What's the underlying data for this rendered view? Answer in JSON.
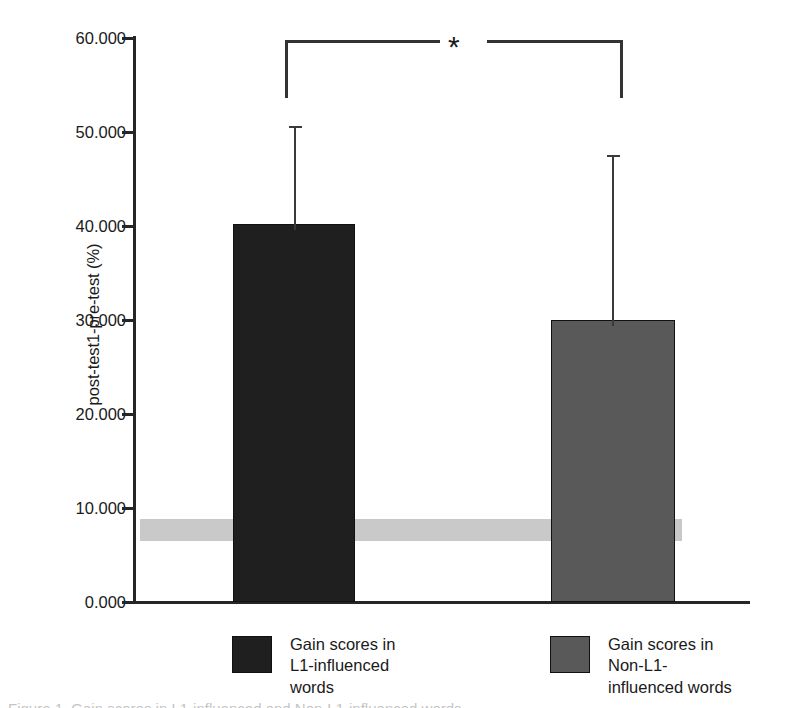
{
  "chart_data": {
    "type": "bar",
    "title": "",
    "xlabel": "",
    "ylabel": "post-test1-pre-test (%)",
    "categories": [
      "Gain scores in L1-influenced words",
      "Gain scores in Non-L1-influenced words"
    ],
    "values": [
      40.0,
      30.0
    ],
    "errors_upper": [
      10.6,
      17.5
    ],
    "error_tops": [
      50.6,
      47.5
    ],
    "ylim": [
      0,
      60
    ],
    "ytick_labels": [
      "60.000",
      "50.000",
      "40.000",
      "30.000",
      "20.000",
      "10.000",
      "0.000"
    ],
    "ytick_values": [
      60,
      50,
      40,
      30,
      20,
      10,
      0
    ],
    "grid": false,
    "legend_position": "below-axis",
    "bar_colors": [
      "#1f1f1f",
      "#595959"
    ],
    "reference_band": {
      "label": "",
      "upper": 8.8,
      "lower": 6.5,
      "color": "#c9c9c9"
    },
    "annotations": [
      {
        "type": "significance-bracket",
        "label": "*",
        "between": [
          "Gain scores in L1-influenced words",
          "Gain scores in Non-L1-influenced words"
        ],
        "level": 62.3
      }
    ]
  },
  "axis": {
    "y_title": "post-test1-pre-test (%)",
    "ticks": [
      {
        "label": "60.000",
        "y": 38
      },
      {
        "label": "50.000",
        "y": 132
      },
      {
        "label": "40.000",
        "y": 226
      },
      {
        "label": "30.000",
        "y": 320
      },
      {
        "label": "20.000",
        "y": 414
      },
      {
        "label": "10.000",
        "y": 508
      },
      {
        "label": "0.000",
        "y": 602
      }
    ]
  },
  "bars": [
    {
      "name": "l1-influenced",
      "value": 40.0,
      "color": "#1f1f1f",
      "x": 233,
      "width": 122,
      "top": 224,
      "height": 378,
      "error_center_x": 294,
      "error_top": 126,
      "error_cap_width": 13
    },
    {
      "name": "non-l1-influenced",
      "value": 30.0,
      "color": "#595959",
      "x": 551,
      "width": 124,
      "top": 320,
      "height": 282,
      "error_center_x": 612,
      "error_top": 155,
      "error_cap_width": 13
    }
  ],
  "significance": {
    "star": "*",
    "left_arm_x": 285,
    "right_arm_x": 620,
    "top_y": 40,
    "bottom_y": 98,
    "gap_left": 440,
    "gap_right": 487
  },
  "legend": {
    "items": [
      {
        "name": "l1-influenced",
        "label": "Gain scores in\nL1-influenced\nwords",
        "color": "#1f1f1f",
        "x": 232,
        "y": 22
      },
      {
        "name": "non-l1-influenced",
        "label": "Gain scores in\nNon-L1-\ninfluenced words",
        "color": "#595959",
        "x": 550,
        "y": 22
      }
    ]
  },
  "caption": {
    "text": "Figure 1. Gain scores in L1-influenced and Non-L1-influenced words"
  }
}
